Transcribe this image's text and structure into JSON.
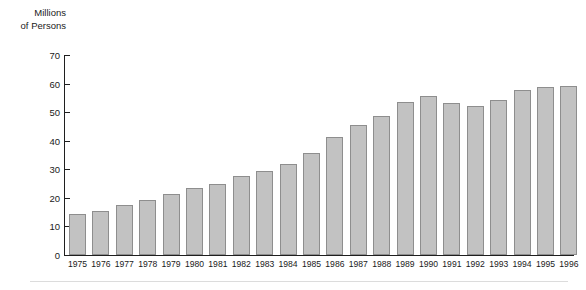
{
  "chart_data": {
    "type": "bar",
    "title": "Millions\nof Persons",
    "xlabel": "",
    "ylabel": "Millions of Persons",
    "ylim": [
      0,
      70
    ],
    "yticks": [
      0,
      10,
      20,
      30,
      40,
      50,
      60,
      70
    ],
    "grid": false,
    "legend": false,
    "bar_fill_color": "#c2c2c2",
    "bar_border_color": "#8e8e8e",
    "axis_color": "#1f1f1f",
    "categories": [
      "1975",
      "1976",
      "1977",
      "1978",
      "1979",
      "1980",
      "1981",
      "1982",
      "1983",
      "1984",
      "1985",
      "1986",
      "1987",
      "1988",
      "1989",
      "1990",
      "1991",
      "1992",
      "1993",
      "1994",
      "1995",
      "1996"
    ],
    "values": [
      14.2,
      15.4,
      17.6,
      19.2,
      21.2,
      23.5,
      24.8,
      27.7,
      29.4,
      32.0,
      35.6,
      41.2,
      45.5,
      48.5,
      53.5,
      55.8,
      53.1,
      52.3,
      54.2,
      57.8,
      58.7,
      59.2
    ]
  },
  "footer": {
    "rule_color": "#dcdcdc"
  }
}
